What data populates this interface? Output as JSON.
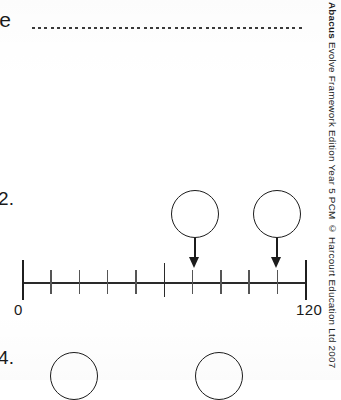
{
  "page": {
    "background_color": "#ffffff",
    "ink_color": "#1c1c1c"
  },
  "header": {
    "name_label": "ne",
    "name_dotted_line": true
  },
  "copyright": {
    "brand": "Abacus",
    "text": " Evolve Framework Edition Year 5 PCM © Harcourt Education Ltd 2007"
  },
  "questions": [
    {
      "number": "2.",
      "bubbles": [
        "",
        ""
      ],
      "chart_data": {
        "type": "line",
        "title": "",
        "xlabel": "",
        "ylabel": "",
        "orientation": "horizontal",
        "xlim": [
          0,
          120
        ],
        "tick_labels": [
          "0",
          "120"
        ],
        "start_label": "0",
        "end_label": "120",
        "major_interval": 60,
        "minor_interval": 12,
        "ticks": [
          0,
          12,
          24,
          36,
          48,
          60,
          72,
          84,
          96,
          108,
          120
        ],
        "grid": false,
        "legend": "none",
        "markers": [
          {
            "position_px": 195,
            "type": "arrow",
            "label": ""
          },
          {
            "position_px": 277,
            "type": "arrow",
            "label": ""
          }
        ]
      }
    },
    {
      "number": "4.",
      "bubbles": [
        "",
        ""
      ]
    }
  ]
}
